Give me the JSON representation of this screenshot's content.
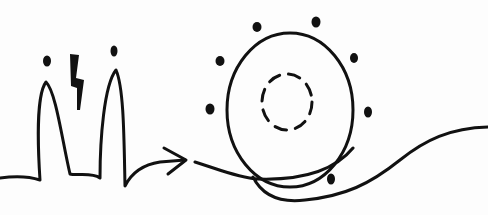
{
  "diagram": {
    "title": "Hand-drawn sketch: signal peaks with spark flowing into a circular orbit",
    "colors": {
      "background": "#fdfdfd",
      "ink": "#111111"
    },
    "elements": {
      "peaks_panel": {
        "label": "Two peaks with dots and a lightning bolt",
        "peaks": 2,
        "dots": 2,
        "has_lightning": true
      },
      "arrow": {
        "label": "Arrow pointing right",
        "direction": "right"
      },
      "orbit_panel": {
        "label": "Circle with dashed inner circle surrounded by dots",
        "outer_circle": "solid",
        "inner_circle": "dashed",
        "surrounding_dots": 7
      },
      "wave": {
        "label": "Wavy line looping under the circle and exiting right"
      }
    }
  }
}
